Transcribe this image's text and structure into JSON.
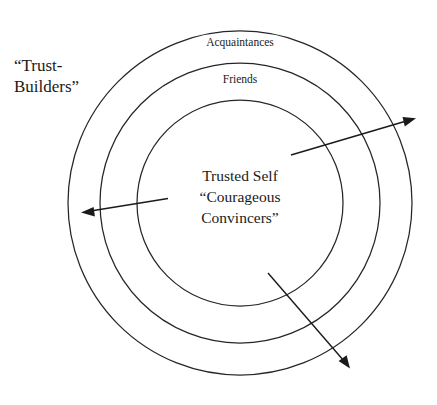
{
  "diagram": {
    "background_color": "#ffffff",
    "stroke_color": "#262626",
    "text_color": "#1a1a1a",
    "outside_label": {
      "line1": "“Trust-",
      "line2": "Builders”"
    },
    "rings": [
      {
        "name": "outer-ring",
        "label": "Acquaintances",
        "radius": 172
      },
      {
        "name": "middle-ring",
        "label": "Friends",
        "radius": 140
      },
      {
        "name": "inner-ring",
        "label": "Trusted Self",
        "radius": 103
      }
    ],
    "center": {
      "line1": "Trusted Self",
      "line2": "“Courageous",
      "line3": "Convincers”"
    },
    "arrows": [
      {
        "name": "arrow-upper-right",
        "direction": "outward-upper-right",
        "from": [
          291,
          155
        ],
        "to": [
          414,
          119
        ]
      },
      {
        "name": "arrow-left",
        "direction": "outward-left",
        "from": [
          168,
          198
        ],
        "to": [
          82,
          212
        ]
      },
      {
        "name": "arrow-lower-right",
        "direction": "outward-lower-right",
        "from": [
          268,
          273
        ],
        "to": [
          349,
          368
        ]
      }
    ]
  }
}
